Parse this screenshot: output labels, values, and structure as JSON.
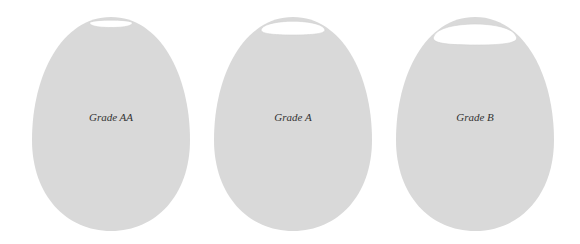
{
  "diagram": {
    "type": "egg-grade-comparison",
    "colors": {
      "background": "#ffffff",
      "egg_fill": "#d9d9d9",
      "air_cell_fill": "#ffffff",
      "air_cell_stroke": "#cfcfcf",
      "label_color": "#333333"
    },
    "eggs": [
      {
        "label": "Grade AA",
        "center_x": 111,
        "top": 17,
        "bottom": 231,
        "width": 158,
        "air_cell": {
          "width": 41,
          "depth": 7
        }
      },
      {
        "label": "Grade A",
        "center_x": 293,
        "top": 17,
        "bottom": 231,
        "width": 158,
        "air_cell": {
          "width": 64,
          "depth": 14
        }
      },
      {
        "label": "Grade B",
        "center_x": 475,
        "top": 17,
        "bottom": 231,
        "width": 158,
        "air_cell": {
          "width": 86,
          "depth": 20
        }
      }
    ]
  }
}
